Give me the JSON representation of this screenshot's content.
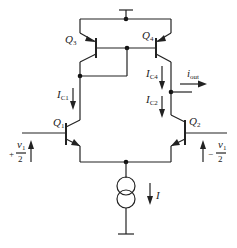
{
  "diagram": {
    "type": "circuit-schematic",
    "transistors": [
      {
        "name": "Q",
        "sub": "3",
        "type": "pnp"
      },
      {
        "name": "Q",
        "sub": "4",
        "type": "pnp"
      },
      {
        "name": "Q",
        "sub": "1",
        "type": "npn"
      },
      {
        "name": "Q",
        "sub": "2",
        "type": "npn"
      }
    ],
    "currents": {
      "ic1": {
        "name": "I",
        "sub": "C1"
      },
      "ic4": {
        "name": "I",
        "sub": "C4"
      },
      "ic2": {
        "name": "I",
        "sub": "C2"
      },
      "iout": {
        "name": "i",
        "sub": "out"
      },
      "tail": {
        "name": "I"
      }
    },
    "inputs": {
      "left": {
        "sign": "+",
        "num": "v",
        "num_sub": "1",
        "den": "2"
      },
      "right": {
        "sign": "−",
        "num": "v",
        "num_sub": "1",
        "den": "2"
      }
    }
  }
}
